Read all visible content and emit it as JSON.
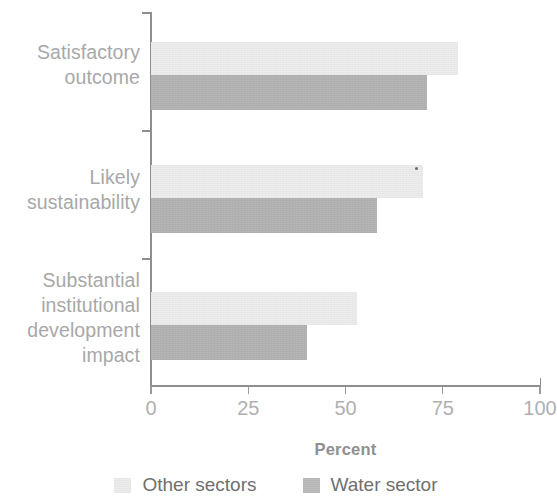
{
  "chart_data": {
    "type": "bar",
    "orientation": "horizontal",
    "title": "",
    "xlabel": "Percent",
    "ylabel": "",
    "xlim": [
      0,
      100
    ],
    "xticks": [
      0,
      25,
      50,
      75,
      100
    ],
    "xtick_labels": [
      "0",
      "25",
      "50",
      "75",
      "100"
    ],
    "grid": false,
    "legend_position": "bottom",
    "categories": [
      "Satisfactory outcome",
      "Likely sustainability",
      "Substantial institutional development impact"
    ],
    "category_lines": [
      [
        "Satisfactory",
        "outcome"
      ],
      [
        "Likely",
        "sustainability"
      ],
      [
        "Substantial",
        "institutional",
        "development",
        "impact"
      ]
    ],
    "series": [
      {
        "name": "Other sectors",
        "color": "#ededed",
        "values": [
          79,
          70,
          53
        ]
      },
      {
        "name": "Water sector",
        "color": "#b3b3b3",
        "values": [
          71,
          58,
          40
        ]
      }
    ]
  },
  "axis": {
    "x_title": "Percent",
    "tick_labels": [
      "0",
      "25",
      "50",
      "75",
      "100"
    ]
  },
  "legend": {
    "items": [
      {
        "label": "Other sectors",
        "swatch": "light"
      },
      {
        "label": "Water sector",
        "swatch": "dark"
      }
    ]
  },
  "categories": {
    "c0": {
      "l0": "Satisfactory",
      "l1": "outcome"
    },
    "c1": {
      "l0": "Likely",
      "l1": "sustainability"
    },
    "c2": {
      "l0": "Substantial",
      "l1": "institutional",
      "l2": "development",
      "l3": "impact"
    }
  }
}
